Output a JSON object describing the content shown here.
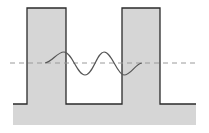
{
  "diagram": {
    "type": "double-barrier-potential-with-wave",
    "colors": {
      "fill": "#d6d6d6",
      "outline": "#2b2b2b",
      "wave": "#555555",
      "reference_line": "#9a9a9a",
      "background": "#ffffff"
    },
    "elements": [
      {
        "name": "left-barrier",
        "x_range": [
          27,
          66
        ],
        "top": 8
      },
      {
        "name": "right-barrier",
        "x_range": [
          122,
          160
        ],
        "top": 8
      },
      {
        "name": "base-floor",
        "top": 104,
        "bottom": 125,
        "x_range": [
          13,
          196
        ]
      },
      {
        "name": "energy-level-dashed-line",
        "y": 63,
        "x_range": [
          10,
          196
        ]
      },
      {
        "name": "wave-function",
        "x_range": [
          45,
          142
        ]
      }
    ]
  }
}
